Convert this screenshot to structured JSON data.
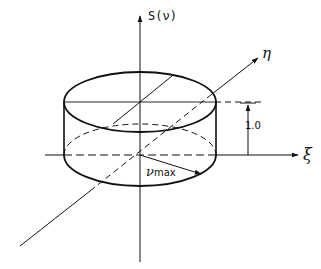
{
  "diagram": {
    "type": "cylinder-plot",
    "axes": {
      "vertical": "S(ν)",
      "depth": "η",
      "horizontal": "ξ"
    },
    "height_marker": "1.0",
    "radius_label": {
      "symbol": "ν",
      "subscript": "max"
    },
    "colors": {
      "ink": "#111111",
      "background": "#ffffff"
    }
  }
}
